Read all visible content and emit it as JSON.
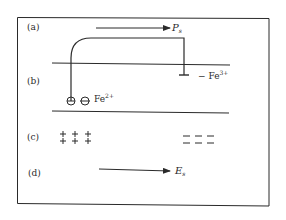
{
  "diagram": {
    "panels": [
      {
        "id": "a",
        "label": "(a)"
      },
      {
        "id": "b",
        "label": "(b)"
      },
      {
        "id": "c",
        "label": "(c)"
      },
      {
        "id": "d",
        "label": "(d)"
      }
    ],
    "arrow_a": {
      "symbol": "P",
      "subscript": "s"
    },
    "arrow_d": {
      "symbol": "E",
      "subscript": "s"
    },
    "ion_left": {
      "prefix": "Fe",
      "charge": "2+"
    },
    "ion_right": {
      "prefix": "− Fe",
      "charge": "3+"
    },
    "plus_char": "+",
    "minus_char": "−",
    "colors": {
      "ink": "#2a2a2a",
      "background": "#ffffff"
    }
  }
}
